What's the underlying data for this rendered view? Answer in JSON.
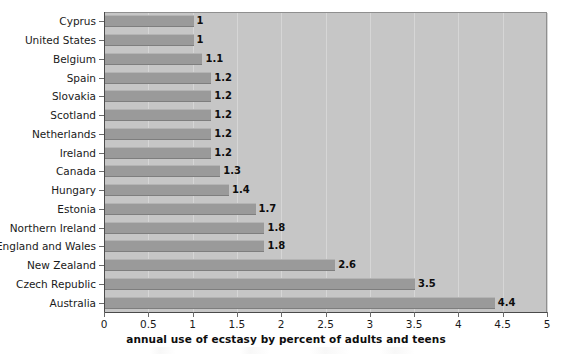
{
  "chart_data": {
    "type": "bar",
    "orientation": "horizontal",
    "title": "",
    "xlabel": "annual use of ecstasy by percent of adults and teens",
    "ylabel": "",
    "xlim": [
      0,
      5
    ],
    "xticks": [
      "0",
      "0.5",
      "1",
      "1.5",
      "2",
      "2.5",
      "3",
      "3.5",
      "4",
      "4.5",
      "5"
    ],
    "xtick_values": [
      0,
      0.5,
      1,
      1.5,
      2,
      2.5,
      3,
      3.5,
      4,
      4.5,
      5
    ],
    "grid": true,
    "legend": false,
    "categories": [
      "Cyprus",
      "United States",
      "Belgium",
      "Spain",
      "Slovakia",
      "Scotland",
      "Netherlands",
      "Ireland",
      "Canada",
      "Hungary",
      "Estonia",
      "Northern Ireland",
      "England and Wales",
      "New Zealand",
      "Czech Republic",
      "Australia"
    ],
    "values": [
      1,
      1,
      1.1,
      1.2,
      1.2,
      1.2,
      1.2,
      1.2,
      1.3,
      1.4,
      1.7,
      1.8,
      1.8,
      2.6,
      3.5,
      4.4
    ],
    "value_labels": [
      "1",
      "1",
      "1.1",
      "1.2",
      "1.2",
      "1.2",
      "1.2",
      "1.2",
      "1.3",
      "1.4",
      "1.7",
      "1.8",
      "1.8",
      "2.6",
      "3.5",
      "4.4"
    ]
  },
  "colors": {
    "bar": "#9a9a9a",
    "plot_background": "#c6c6c6",
    "page_background": "#ffffff",
    "axis": "#4a4a4a",
    "gridline": "#d6d6d6",
    "text": "#1a1a1a"
  }
}
